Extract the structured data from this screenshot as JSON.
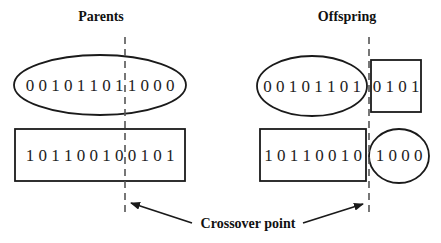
{
  "titles": {
    "parents": "Parents",
    "offspring": "Offspring"
  },
  "parents": {
    "chromosome_1": {
      "shape": "ellipse",
      "bits": "0 0 1 0 1 1 0 1 1 0 0 0",
      "value": "001011011000"
    },
    "chromosome_2": {
      "shape": "rectangle",
      "bits": "1 0 1 1 0 0 1 0 0 1 0 1",
      "value": "101100100101"
    }
  },
  "offspring": {
    "child_1": {
      "head": {
        "shape": "ellipse",
        "bits": "0 0 1 0 1 1 0 1",
        "value": "00101101"
      },
      "tail": {
        "shape": "square",
        "bits": "0 1 0 1",
        "value": "0101"
      }
    },
    "child_2": {
      "head": {
        "shape": "rectangle",
        "bits": "1 0 1 1 0 0 1 0",
        "value": "10110010"
      },
      "tail": {
        "shape": "circle",
        "bits": "1 0 0 0",
        "value": "1000"
      }
    }
  },
  "annotation": {
    "label": "Crossover point"
  },
  "colors": {
    "stroke": "#1a1a1a",
    "dashed_line": "#555555",
    "background": "#ffffff"
  }
}
